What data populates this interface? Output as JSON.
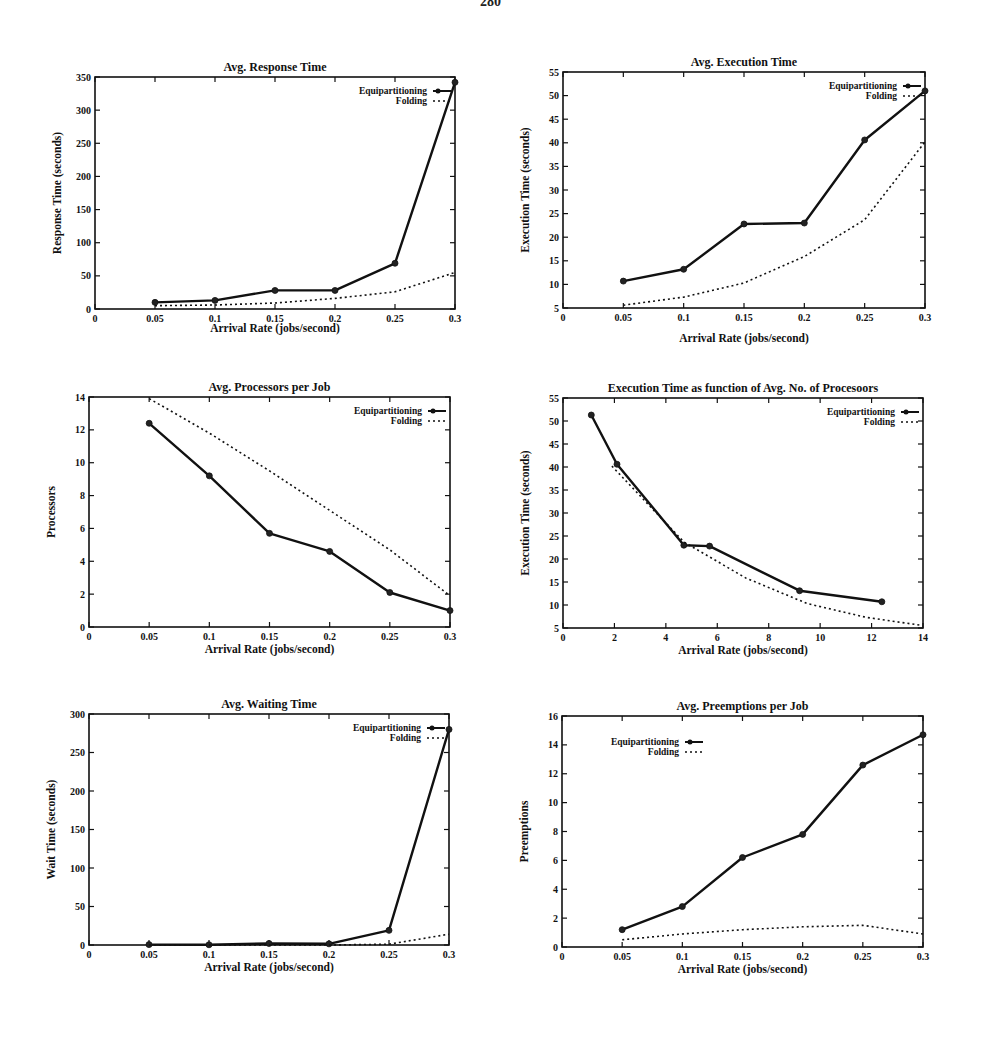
{
  "page": {
    "number": "280"
  },
  "legend": {
    "series_a": "Equipartitioning",
    "series_b": "Folding"
  },
  "chart_data": [
    {
      "id": "response-time",
      "type": "line",
      "title": "Avg. Response Time",
      "xlabel": "Arrival Rate (jobs/second)",
      "ylabel": "Response Time (seconds)",
      "xlim": [
        0,
        0.3
      ],
      "ylim": [
        0,
        350
      ],
      "xticks": [
        0,
        0.05,
        0.1,
        0.15,
        0.2,
        0.25,
        0.3
      ],
      "yticks": [
        0,
        50,
        100,
        150,
        200,
        250,
        300,
        350
      ],
      "grid": false,
      "legend_position": "top-right",
      "frame": {
        "left": 95,
        "top": 77,
        "right": 455,
        "bottom": 309
      },
      "series": [
        {
          "name": "Equipartitioning",
          "style": "solid-markers",
          "x": [
            0.05,
            0.1,
            0.15,
            0.2,
            0.25,
            0.3
          ],
          "y": [
            10,
            13,
            28,
            28,
            69,
            342
          ]
        },
        {
          "name": "Folding",
          "style": "dotted",
          "x": [
            0.05,
            0.1,
            0.15,
            0.2,
            0.25,
            0.3
          ],
          "y": [
            5,
            6,
            9,
            16,
            26,
            55
          ]
        }
      ]
    },
    {
      "id": "execution-time",
      "type": "line",
      "title": "Avg. Execution Time",
      "xlabel": "Arrival Rate (jobs/second)",
      "ylabel": "Execution Time (seconds)",
      "xlim": [
        0,
        0.3
      ],
      "ylim": [
        5,
        55
      ],
      "xticks": [
        0,
        0.05,
        0.1,
        0.15,
        0.2,
        0.25,
        0.3
      ],
      "yticks": [
        5,
        10,
        15,
        20,
        25,
        30,
        35,
        40,
        45,
        50,
        55
      ],
      "grid": false,
      "legend_position": "top-right",
      "frame": {
        "left": 563,
        "top": 72,
        "right": 925,
        "bottom": 308
      },
      "series": [
        {
          "name": "Equipartitioning",
          "style": "solid-markers",
          "x": [
            0.05,
            0.1,
            0.15,
            0.2,
            0.25,
            0.3
          ],
          "y": [
            10.7,
            13.2,
            22.8,
            23.0,
            40.6,
            51.0
          ]
        },
        {
          "name": "Folding",
          "style": "dotted",
          "x": [
            0.05,
            0.1,
            0.15,
            0.2,
            0.25,
            0.3
          ],
          "y": [
            5.6,
            7.3,
            10.3,
            15.9,
            23.7,
            40.2
          ]
        }
      ]
    },
    {
      "id": "processors-per-job",
      "type": "line",
      "title": "Avg. Processors per Job",
      "xlabel": "Arrival Rate (jobs/second)",
      "ylabel": "Processors",
      "xlim": [
        0,
        0.3
      ],
      "ylim": [
        0,
        14
      ],
      "xticks": [
        0,
        0.05,
        0.1,
        0.15,
        0.2,
        0.25,
        0.3
      ],
      "yticks": [
        0,
        2,
        4,
        6,
        8,
        10,
        12,
        14
      ],
      "grid": false,
      "legend_position": "top-right",
      "frame": {
        "left": 89,
        "top": 397,
        "right": 450,
        "bottom": 627
      },
      "series": [
        {
          "name": "Equipartitioning",
          "style": "solid-markers",
          "x": [
            0.05,
            0.1,
            0.15,
            0.2,
            0.25,
            0.3
          ],
          "y": [
            12.4,
            9.2,
            5.7,
            4.6,
            2.1,
            1.0
          ]
        },
        {
          "name": "Folding",
          "style": "dotted",
          "x": [
            0.05,
            0.1,
            0.15,
            0.2,
            0.25,
            0.3
          ],
          "y": [
            13.9,
            11.8,
            9.5,
            7.1,
            4.7,
            1.9
          ]
        }
      ]
    },
    {
      "id": "exec-time-vs-processors",
      "type": "line",
      "title": "Execution Time as function of Avg. No. of Procesoors",
      "xlabel": "Arrival Rate (jobs/second)",
      "ylabel": "Execution Time (seconds)",
      "xlim": [
        0,
        14
      ],
      "ylim": [
        5,
        55
      ],
      "xticks": [
        0,
        2,
        4,
        6,
        8,
        10,
        12,
        14
      ],
      "yticks": [
        5,
        10,
        15,
        20,
        25,
        30,
        35,
        40,
        45,
        50,
        55
      ],
      "grid": false,
      "legend_position": "top-right",
      "frame": {
        "left": 563,
        "top": 398,
        "right": 923,
        "bottom": 628
      },
      "series": [
        {
          "name": "Equipartitioning",
          "style": "solid-markers",
          "x": [
            1.1,
            2.1,
            4.7,
            5.7,
            9.2,
            12.4
          ],
          "y": [
            51.3,
            40.6,
            23.0,
            22.8,
            13.1,
            10.7
          ]
        },
        {
          "name": "Folding",
          "style": "dotted",
          "x": [
            1.9,
            4.7,
            7.1,
            9.5,
            11.8,
            13.9
          ],
          "y": [
            40.2,
            23.7,
            15.9,
            10.3,
            7.3,
            5.6
          ]
        }
      ]
    },
    {
      "id": "waiting-time",
      "type": "line",
      "title": "Avg. Waiting Time",
      "xlabel": "Arrival Rate (jobs/second)",
      "ylabel": "Wait Time (seconds)",
      "xlim": [
        0,
        0.3
      ],
      "ylim": [
        0,
        300
      ],
      "xticks": [
        0,
        0.05,
        0.1,
        0.15,
        0.2,
        0.25,
        0.3
      ],
      "yticks": [
        0,
        50,
        100,
        150,
        200,
        250,
        300
      ],
      "grid": false,
      "legend_position": "top-right",
      "frame": {
        "left": 89,
        "top": 714,
        "right": 449,
        "bottom": 945
      },
      "series": [
        {
          "name": "Equipartitioning",
          "style": "solid-markers",
          "x": [
            0.05,
            0.1,
            0.15,
            0.2,
            0.25,
            0.3
          ],
          "y": [
            0.5,
            0.3,
            2.0,
            1.5,
            19,
            280
          ]
        },
        {
          "name": "Folding",
          "style": "dotted",
          "x": [
            0.05,
            0.1,
            0.15,
            0.2,
            0.25,
            0.3
          ],
          "y": [
            0,
            0,
            0,
            0,
            1,
            14
          ]
        }
      ]
    },
    {
      "id": "preemptions-per-job",
      "type": "line",
      "title": "Avg. Preemptions per Job",
      "xlabel": "Arrival Rate (jobs/second)",
      "ylabel": "Preemptions",
      "xlim": [
        0,
        0.3
      ],
      "ylim": [
        0,
        16
      ],
      "xticks": [
        0,
        0.05,
        0.1,
        0.15,
        0.2,
        0.25,
        0.3
      ],
      "yticks": [
        0,
        2,
        4,
        6,
        8,
        10,
        12,
        14,
        16
      ],
      "grid": false,
      "legend_position": "top-left",
      "frame": {
        "left": 562,
        "top": 716,
        "right": 923,
        "bottom": 947
      },
      "series": [
        {
          "name": "Equipartitioning",
          "style": "solid-markers",
          "x": [
            0.05,
            0.1,
            0.15,
            0.2,
            0.25,
            0.3
          ],
          "y": [
            1.2,
            2.8,
            6.2,
            7.8,
            12.6,
            14.7
          ]
        },
        {
          "name": "Folding",
          "style": "dotted",
          "x": [
            0.05,
            0.1,
            0.15,
            0.2,
            0.25,
            0.3
          ],
          "y": [
            0.5,
            0.9,
            1.2,
            1.4,
            1.5,
            0.9
          ]
        }
      ]
    }
  ]
}
